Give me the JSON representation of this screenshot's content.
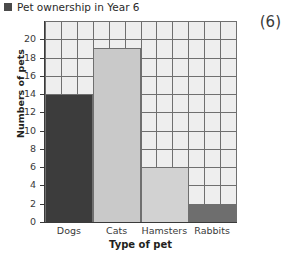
{
  "title": {
    "text": "Pet ownership in Year 6",
    "bullet_icon": "filled-square-icon"
  },
  "score_mark": "(6)",
  "chart_data": {
    "type": "bar",
    "title": "Pet ownership in Year 6",
    "xlabel": "Type of pet",
    "ylabel": "Numbers of pets",
    "categories": [
      "Dogs",
      "Cats",
      "Hamsters",
      "Rabbits"
    ],
    "values": [
      14,
      19,
      6,
      2
    ],
    "bar_colors": [
      "#3c3c3c",
      "#c9c9c9",
      "#d2d2d2",
      "#6e6e6e"
    ],
    "ylim": [
      0,
      22
    ],
    "ytick_labels": [
      "0",
      "2",
      "4",
      "6",
      "8",
      "10",
      "12",
      "14",
      "16",
      "18",
      "20"
    ],
    "ytick_values": [
      0,
      2,
      4,
      6,
      8,
      10,
      12,
      14,
      16,
      18,
      20
    ],
    "grid": true,
    "grid_color": "#6f6f6f",
    "plot_background": "#eeeeee",
    "legend": "none"
  }
}
